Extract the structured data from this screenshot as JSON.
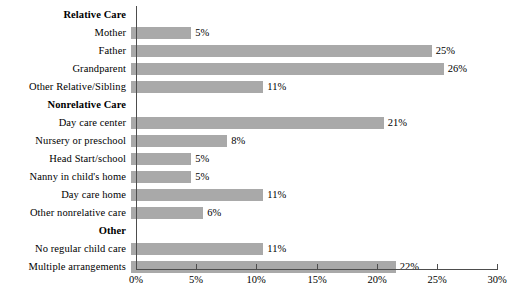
{
  "chart_data": {
    "type": "bar",
    "orientation": "horizontal",
    "title": "",
    "subtitle": "",
    "xlabel": "",
    "ylabel": "",
    "xlim": [
      0,
      30
    ],
    "xtick_labels": [
      "0%",
      "5%",
      "10%",
      "15%",
      "20%",
      "25%",
      "30%"
    ],
    "xticks": [
      0,
      5,
      10,
      15,
      20,
      25,
      30
    ],
    "grid": false,
    "legend": false,
    "bar_color": "#a9a9a9",
    "axis_color": "#4d4d4d",
    "value_suffix": "%",
    "rows": [
      {
        "label": "Relative Care",
        "type": "header",
        "value": null,
        "value_label": ""
      },
      {
        "label": "Mother",
        "type": "bar",
        "value": 5,
        "value_label": "5%"
      },
      {
        "label": "Father",
        "type": "bar",
        "value": 25,
        "value_label": "25%"
      },
      {
        "label": "Grandparent",
        "type": "bar",
        "value": 26,
        "value_label": "26%"
      },
      {
        "label": "Other Relative/Sibling",
        "type": "bar",
        "value": 11,
        "value_label": "11%"
      },
      {
        "label": "Nonrelative Care",
        "type": "header",
        "value": null,
        "value_label": ""
      },
      {
        "label": "Day care center",
        "type": "bar",
        "value": 21,
        "value_label": "21%"
      },
      {
        "label": "Nursery or preschool",
        "type": "bar",
        "value": 8,
        "value_label": "8%"
      },
      {
        "label": "Head Start/school",
        "type": "bar",
        "value": 5,
        "value_label": "5%"
      },
      {
        "label": "Nanny in child's home",
        "type": "bar",
        "value": 5,
        "value_label": "5%"
      },
      {
        "label": "Day care home",
        "type": "bar",
        "value": 11,
        "value_label": "11%"
      },
      {
        "label": "Other nonrelative care",
        "type": "bar",
        "value": 6,
        "value_label": "6%"
      },
      {
        "label": "Other",
        "type": "header",
        "value": null,
        "value_label": ""
      },
      {
        "label": "No regular child care",
        "type": "bar",
        "value": 11,
        "value_label": "11%"
      },
      {
        "label": "Multiple arrangements",
        "type": "bar",
        "value": 22,
        "value_label": "22%"
      }
    ]
  }
}
